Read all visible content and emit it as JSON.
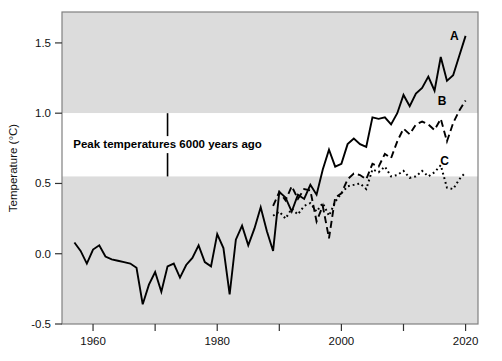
{
  "chart_data": {
    "type": "line",
    "title": "",
    "xlabel": "",
    "ylabel": "Temperature (°C)",
    "xlim": [
      1955,
      2022
    ],
    "ylim": [
      -0.5,
      1.72
    ],
    "grid": false,
    "legend_position": "inline-right-end-labels",
    "x_ticks_major": [
      1960,
      1980,
      2000,
      2020
    ],
    "x_ticks_minor": [
      1970,
      1990,
      2010
    ],
    "x_tick_labels": [
      "1960",
      "1980",
      "2000",
      "2020"
    ],
    "y_ticks": [
      -0.5,
      0.0,
      0.5,
      1.0,
      1.5
    ],
    "y_tick_labels": [
      "-0.5",
      "0.0",
      "0.5",
      "1.0",
      "1.5"
    ],
    "shaded_bands": [
      {
        "name": "upper-gray-band",
        "from": 1.0,
        "to": 1.72,
        "color": "#dcdcdc"
      },
      {
        "name": "white-band",
        "from": 0.55,
        "to": 1.0,
        "color": "#ffffff"
      },
      {
        "name": "lower-gray-band",
        "from": -0.5,
        "to": 0.55,
        "color": "#dcdcdc"
      }
    ],
    "annotations": [
      {
        "name": "peak-temperatures-note",
        "text": "Peak temperatures 6000 years ago",
        "x": 1972,
        "y": 0.78,
        "marker": "vertical-line",
        "line_from": 0.55,
        "line_to": 1.0
      }
    ],
    "series": [
      {
        "name": "A",
        "label": "A",
        "style": "solid",
        "color": "#000000",
        "label_x": 2018.2,
        "label_y": 1.52,
        "x": [
          1957,
          1958,
          1959,
          1960,
          1961,
          1962,
          1963,
          1964,
          1965,
          1966,
          1967,
          1968,
          1969,
          1970,
          1971,
          1972,
          1973,
          1974,
          1975,
          1976,
          1977,
          1978,
          1979,
          1980,
          1981,
          1982,
          1983,
          1984,
          1985,
          1986,
          1987,
          1988,
          1989,
          1990,
          1991,
          1992,
          1993,
          1994,
          1995,
          1996,
          1997,
          1998,
          1999,
          2000,
          2001,
          2002,
          2003,
          2004,
          2005,
          2006,
          2007,
          2008,
          2009,
          2010,
          2011,
          2012,
          2013,
          2014,
          2015,
          2016,
          2017,
          2018,
          2019,
          2020
        ],
        "y": [
          0.08,
          0.02,
          -0.07,
          0.03,
          0.06,
          -0.02,
          -0.04,
          -0.05,
          -0.06,
          -0.07,
          -0.1,
          -0.36,
          -0.22,
          -0.13,
          -0.27,
          -0.09,
          -0.07,
          -0.17,
          -0.08,
          -0.03,
          0.06,
          -0.06,
          -0.09,
          0.14,
          0.04,
          -0.29,
          0.1,
          0.2,
          0.06,
          0.18,
          0.33,
          0.16,
          0.02,
          0.44,
          0.4,
          0.3,
          0.42,
          0.39,
          0.49,
          0.42,
          0.6,
          0.74,
          0.62,
          0.64,
          0.78,
          0.82,
          0.78,
          0.76,
          0.97,
          0.96,
          0.97,
          0.92,
          1.0,
          1.13,
          1.05,
          1.14,
          1.18,
          1.26,
          1.16,
          1.4,
          1.23,
          1.27,
          1.41,
          1.55
        ]
      },
      {
        "name": "B",
        "label": "B",
        "style": "dashed",
        "color": "#000000",
        "label_x": 2016.2,
        "label_y": 1.06,
        "x": [
          1989,
          1990,
          1991,
          1992,
          1993,
          1994,
          1995,
          1996,
          1997,
          1998,
          1999,
          2000,
          2001,
          2002,
          2003,
          2004,
          2005,
          2006,
          2007,
          2008,
          2009,
          2010,
          2011,
          2012,
          2013,
          2014,
          2015,
          2016,
          2017,
          2018,
          2019,
          2020
        ],
        "y": [
          0.34,
          0.44,
          0.38,
          0.48,
          0.39,
          0.46,
          0.45,
          0.23,
          0.34,
          0.11,
          0.4,
          0.43,
          0.53,
          0.57,
          0.56,
          0.53,
          0.64,
          0.62,
          0.71,
          0.68,
          0.8,
          0.89,
          0.85,
          0.92,
          0.94,
          0.92,
          0.88,
          0.96,
          0.8,
          0.93,
          1.02,
          1.09
        ]
      },
      {
        "name": "C",
        "label": "C",
        "style": "dotted",
        "color": "#000000",
        "label_x": 2016.6,
        "label_y": 0.63,
        "x": [
          1989,
          1990,
          1991,
          1992,
          1993,
          1994,
          1995,
          1996,
          1997,
          1998,
          1999,
          2000,
          2001,
          2002,
          2003,
          2004,
          2005,
          2006,
          2007,
          2008,
          2009,
          2010,
          2011,
          2012,
          2013,
          2014,
          2015,
          2016,
          2017,
          2018,
          2019,
          2020
        ],
        "y": [
          0.27,
          0.3,
          0.25,
          0.32,
          0.28,
          0.34,
          0.36,
          0.3,
          0.36,
          0.27,
          0.37,
          0.43,
          0.48,
          0.49,
          0.5,
          0.46,
          0.6,
          0.58,
          0.62,
          0.55,
          0.56,
          0.59,
          0.54,
          0.55,
          0.59,
          0.55,
          0.58,
          0.63,
          0.47,
          0.46,
          0.53,
          0.58
        ]
      }
    ]
  },
  "axes": {
    "y_axis_title": "Temperature (°C)"
  }
}
